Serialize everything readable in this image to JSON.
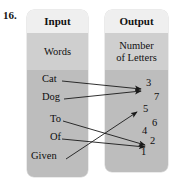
{
  "question": {
    "number": "16."
  },
  "panels": {
    "input": {
      "header": "Input",
      "subtitle_line1": "Words",
      "subtitle_line2": "",
      "items": [
        {
          "label": "Cat",
          "x": 42,
          "y": 84
        },
        {
          "label": "Dog",
          "x": 42,
          "y": 102
        },
        {
          "label": "To",
          "x": 50,
          "y": 124
        },
        {
          "label": "Of",
          "x": 50,
          "y": 142
        },
        {
          "label": "Given",
          "x": 31,
          "y": 161
        }
      ]
    },
    "output": {
      "header": "Output",
      "subtitle_line1": "Number",
      "subtitle_line2": "of Letters",
      "items": [
        {
          "label": "3",
          "x": 146,
          "y": 88
        },
        {
          "label": "7",
          "x": 154,
          "y": 102
        },
        {
          "label": "5",
          "x": 143,
          "y": 114
        },
        {
          "label": "6",
          "x": 152,
          "y": 128
        },
        {
          "label": "4",
          "x": 142,
          "y": 136
        },
        {
          "label": "2",
          "x": 150,
          "y": 146
        },
        {
          "label": "1",
          "x": 141,
          "y": 157
        }
      ]
    }
  },
  "mapping": {
    "type": "arrow-diagram",
    "pairs": [
      {
        "from": "Cat",
        "to": "3"
      },
      {
        "from": "Dog",
        "to": "3"
      },
      {
        "from": "To",
        "to": "2"
      },
      {
        "from": "Of",
        "to": "2"
      },
      {
        "from": "Given",
        "to": "5"
      }
    ],
    "arrows": [
      {
        "name": "arrow-cat-to-3",
        "x1": 62,
        "y1": 81,
        "x2": 141,
        "y2": 89
      },
      {
        "name": "arrow-dog-to-3",
        "x1": 64,
        "y1": 99,
        "x2": 141,
        "y2": 91
      },
      {
        "name": "arrow-to-to-2",
        "x1": 63,
        "y1": 121,
        "x2": 145,
        "y2": 145
      },
      {
        "name": "arrow-of-to-2",
        "x1": 62,
        "y1": 139,
        "x2": 145,
        "y2": 147
      },
      {
        "name": "arrow-given-to-5",
        "x1": 66,
        "y1": 159,
        "x2": 137,
        "y2": 112
      }
    ],
    "stroke_color": "#1a1a1a"
  },
  "colors": {
    "page_background": "#ffffff",
    "panel_header": "#efefef",
    "panel_mid": "#cfcfcf",
    "panel_body": "#bdbdbd",
    "text": "#111111"
  }
}
